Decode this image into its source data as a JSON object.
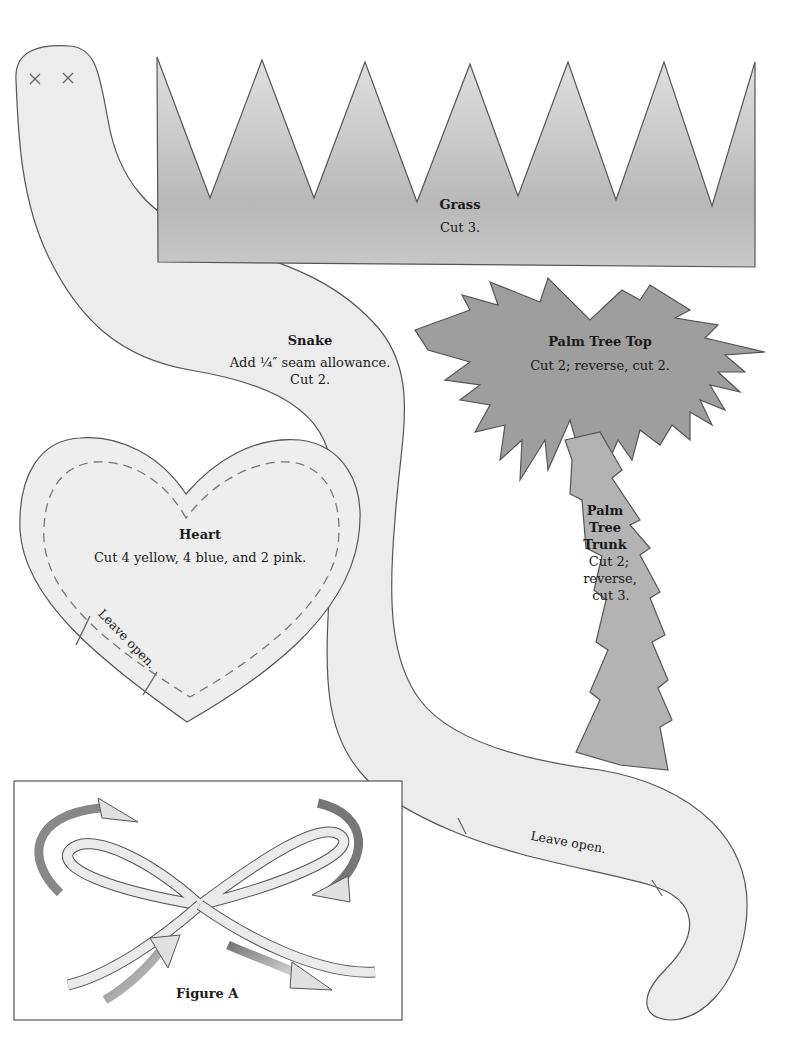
{
  "colors": {
    "snake_fill": "#ececec",
    "grass_fill": "#c2c2c2",
    "palm_top_fill": "#9e9e9e",
    "palm_trunk_fill": "#b3b3b3",
    "heart_fill": "#eeeeee",
    "outline": "#555555",
    "text": "#1a1a1a"
  },
  "patterns": {
    "grass": {
      "title": "Grass",
      "instruction": "Cut 3."
    },
    "snake": {
      "title": "Snake",
      "instruction_line1": "Add ¼″ seam allowance.",
      "instruction_line2": "Cut 2.",
      "leave_open": "Leave open.",
      "eye_marks": [
        "×",
        "×"
      ]
    },
    "palm_tree_top": {
      "title": "Palm Tree Top",
      "instruction": "Cut 2; reverse, cut 2."
    },
    "palm_tree_trunk": {
      "title_line1": "Palm",
      "title_line2": "Tree",
      "title_line3": "Trunk",
      "instruction_line1": "Cut 2;",
      "instruction_line2": "reverse,",
      "instruction_line3": "cut 3."
    },
    "heart": {
      "title": "Heart",
      "instruction": "Cut 4 yellow, 4 blue, and 2 pink.",
      "leave_open": "Leave open."
    }
  },
  "figure_a": {
    "caption": "Figure A"
  }
}
